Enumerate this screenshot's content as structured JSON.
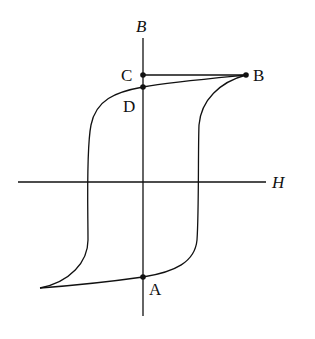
{
  "diagram": {
    "type": "hysteresis-loop",
    "axes": {
      "vertical_label": "B",
      "horizontal_label": "H"
    },
    "points": [
      {
        "id": "C",
        "label": "C"
      },
      {
        "id": "B",
        "label": "B"
      },
      {
        "id": "D",
        "label": "D"
      },
      {
        "id": "A",
        "label": "A"
      }
    ],
    "colors": {
      "stroke": "#111111",
      "background": "#ffffff"
    }
  }
}
